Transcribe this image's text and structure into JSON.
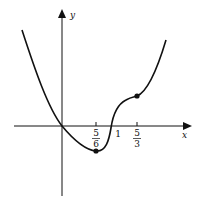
{
  "figure": {
    "type": "function-graph",
    "axes": {
      "x_label": "x",
      "y_label": "y"
    },
    "ticks": [
      {
        "label_num": "5",
        "label_den": "6",
        "value": "5/6"
      },
      {
        "label": "1",
        "value": "1"
      },
      {
        "label_num": "5",
        "label_den": "3",
        "value": "5/3"
      }
    ],
    "points": [
      {
        "name": "local-minimum",
        "x": "5/6"
      },
      {
        "name": "inflection-point",
        "x": "5/3"
      }
    ],
    "colors": {
      "stroke": "#111111",
      "background": "#ffffff"
    }
  }
}
